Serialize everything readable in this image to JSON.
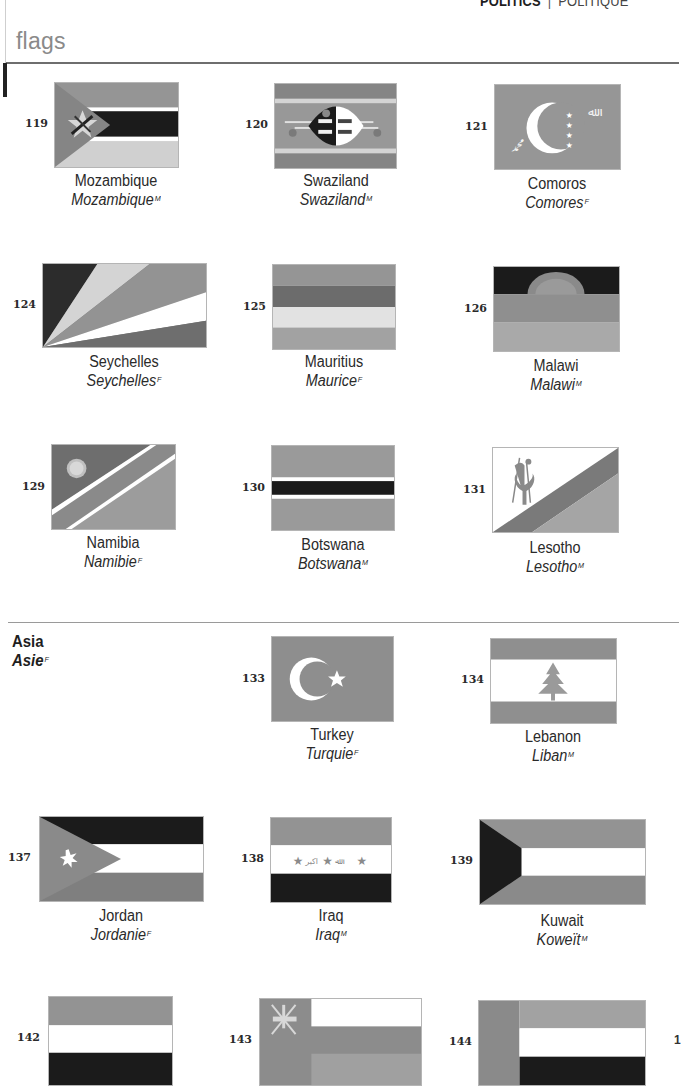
{
  "header": {
    "section_en": "POLITICS",
    "separator": "|",
    "section_fr": "POLITIQUE",
    "page_title": "flags"
  },
  "regions": {
    "asia": {
      "label_en": "Asia",
      "label_fr": "Asie",
      "gender": "F"
    }
  },
  "colors": {
    "gray_dark": "#7d7d7d",
    "gray_mid": "#969696",
    "gray_light": "#b4b4b4",
    "gray_pale": "#d3d3d3",
    "black": "#1b1b1b",
    "white": "#ffffff",
    "text": "#2b2b2b",
    "title_gray": "#8a8a8a"
  },
  "flags": [
    {
      "number": "119",
      "name_en": "Mozambique",
      "name_fr": "Mozambique",
      "gender": "M"
    },
    {
      "number": "120",
      "name_en": "Swaziland",
      "name_fr": "Swaziland",
      "gender": "M"
    },
    {
      "number": "121",
      "name_en": "Comoros",
      "name_fr": "Comores",
      "gender": "F"
    },
    {
      "number": "124",
      "name_en": "Seychelles",
      "name_fr": "Seychelles",
      "gender": "F"
    },
    {
      "number": "125",
      "name_en": "Mauritius",
      "name_fr": "Maurice",
      "gender": "F"
    },
    {
      "number": "126",
      "name_en": "Malawi",
      "name_fr": "Malawi",
      "gender": "M"
    },
    {
      "number": "129",
      "name_en": "Namibia",
      "name_fr": "Namibie",
      "gender": "F"
    },
    {
      "number": "130",
      "name_en": "Botswana",
      "name_fr": "Botswana",
      "gender": "M"
    },
    {
      "number": "131",
      "name_en": "Lesotho",
      "name_fr": "Lesotho",
      "gender": "M"
    },
    {
      "number": "133",
      "name_en": "Turkey",
      "name_fr": "Turquie",
      "gender": "F"
    },
    {
      "number": "134",
      "name_en": "Lebanon",
      "name_fr": "Liban",
      "gender": "M"
    },
    {
      "number": "137",
      "name_en": "Jordan",
      "name_fr": "Jordanie",
      "gender": "F"
    },
    {
      "number": "138",
      "name_en": "Iraq",
      "name_fr": "Iraq",
      "gender": "M"
    },
    {
      "number": "139",
      "name_en": "Kuwait",
      "name_fr": "Koweït",
      "gender": "M"
    },
    {
      "number": "142",
      "name_en": "",
      "name_fr": "",
      "gender": ""
    },
    {
      "number": "143",
      "name_en": "",
      "name_fr": "",
      "gender": ""
    },
    {
      "number": "144",
      "name_en": "",
      "name_fr": "",
      "gender": ""
    }
  ],
  "edge_fragment": "1"
}
